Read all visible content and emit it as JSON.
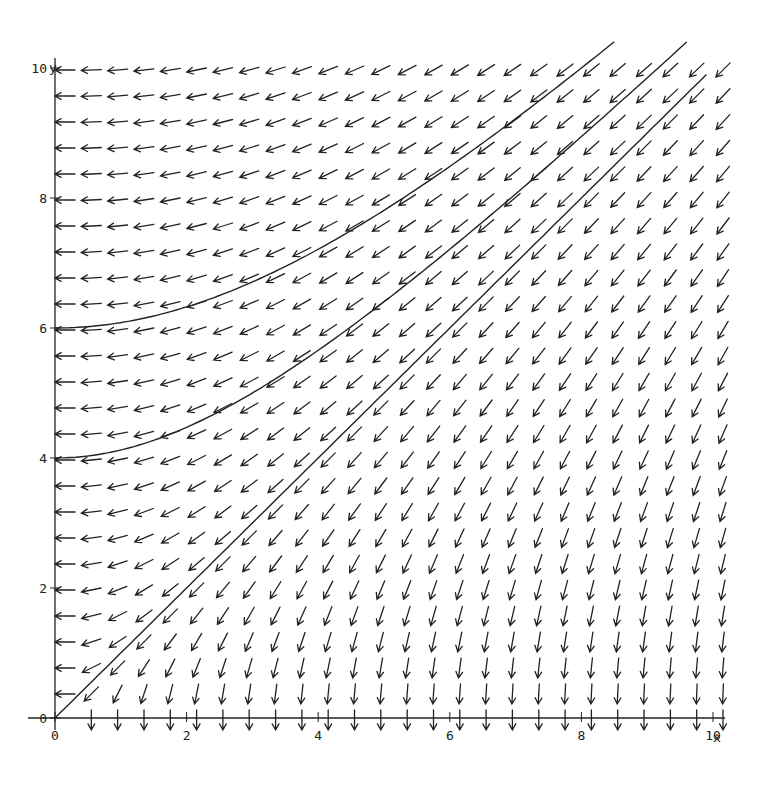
{
  "chart_data": {
    "type": "line",
    "subtype": "direction-field",
    "title": "",
    "xlabel": "x",
    "ylabel": "y",
    "xlim": [
      0,
      10
    ],
    "ylim": [
      0,
      10
    ],
    "x_ticks": [
      0,
      2,
      4,
      6,
      8,
      10
    ],
    "y_ticks": [
      0,
      2,
      4,
      6,
      8,
      10
    ],
    "grid": false,
    "legend": null,
    "field": {
      "description": "direction arrows for dx/dt = -y, dy/dt = -x",
      "spacing": 0.4,
      "x_range": [
        0,
        10
      ],
      "y_range": [
        0,
        10
      ]
    },
    "series": [
      {
        "name": "trajectory through (0,6)",
        "equation": "y^2 - x^2 = 36",
        "start": [
          0,
          6
        ],
        "x_end": 8.5
      },
      {
        "name": "trajectory through (0,4)",
        "equation": "y^2 - x^2 = 16",
        "start": [
          0,
          4
        ],
        "x_end": 9.6
      },
      {
        "name": "trajectory y = x",
        "equation": "y = x",
        "start": [
          0,
          0
        ],
        "x_end": 9.9
      }
    ]
  },
  "colors": {
    "ink": "#222222",
    "background": "#ffffff"
  }
}
